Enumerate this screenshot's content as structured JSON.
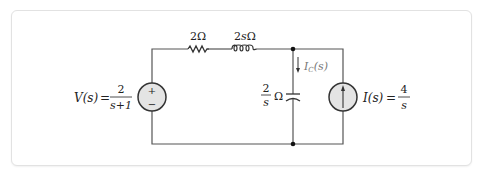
{
  "diagram": {
    "type": "circuit",
    "title": "",
    "components": {
      "resistor": {
        "label": "2Ω"
      },
      "inductor": {
        "label": "2sΩ"
      },
      "capacitor": {
        "label_num": "2",
        "label_den": "s",
        "label_unit": "Ω"
      },
      "voltage_source": {
        "label_lhs": "V(s)",
        "eq": "=",
        "num": "2",
        "den": "s+1",
        "plus": "+",
        "minus": "−"
      },
      "current_source": {
        "label_lhs": "I(s)",
        "eq": "=",
        "num": "4",
        "den": "s"
      },
      "capacitor_current": {
        "label_main": "I",
        "label_sub": "C",
        "label_arg": "(s)"
      }
    },
    "colors": {
      "wire": "#555555",
      "source_fill": "#e4e4e4",
      "source_stroke": "#333333",
      "node": "#111111",
      "current_label": "#777777"
    }
  }
}
